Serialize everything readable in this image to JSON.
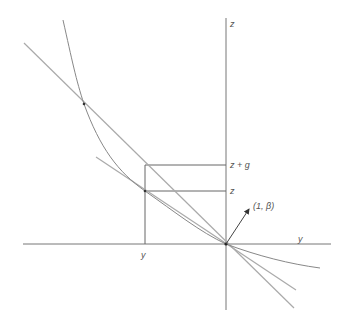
{
  "labels": {
    "z_axis": "z",
    "y_axis": "y",
    "y_tick": "y",
    "z_plus_g": "z + g",
    "z_tick": "z",
    "vector": "(1, β)"
  },
  "colors": {
    "axis": "#777777",
    "curve": "#888888",
    "lines": "#aaaaaa",
    "background": "#ffffff"
  }
}
